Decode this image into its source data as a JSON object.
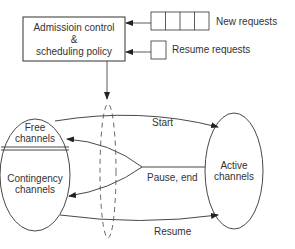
{
  "diagram": {
    "controller_box": {
      "line1": "Admissioin control",
      "line2": "&",
      "line3": "scheduling policy"
    },
    "queues": {
      "new_requests": {
        "label": "New requests",
        "slots": 4
      },
      "resume_requests": {
        "label": "Resume requests",
        "slots": 1
      }
    },
    "pools": {
      "free": {
        "line1": "Free",
        "line2": "channels"
      },
      "contingency": {
        "line1": "Contingency",
        "line2": "channels"
      },
      "active": {
        "line1": "Active",
        "line2": "channels"
      }
    },
    "transitions": {
      "start": "Start",
      "pause_end": "Pause, end",
      "resume": "Resume"
    },
    "colors": {
      "stroke": "#333333",
      "text": "#333333",
      "dashed": "#555555"
    }
  }
}
